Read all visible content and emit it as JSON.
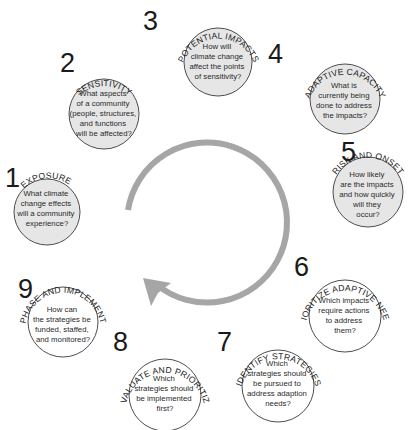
{
  "diagram": {
    "arrow_color": "#a6a6a6",
    "filled_color": "#e6e6e6",
    "empty_color": "#ffffff",
    "steps": [
      {
        "number": "1",
        "title": "EXPOSURE",
        "question_lines": [
          "What climate",
          "change effects",
          "will a community",
          "experience?"
        ],
        "filled": true
      },
      {
        "number": "2",
        "title": "SENSITIVITY",
        "question_lines": [
          "What aspects",
          "of a community",
          "(people, structures,",
          "and functions",
          "will be affected?"
        ],
        "filled": true
      },
      {
        "number": "3",
        "title": "POTENTIAL IMPACTS",
        "question_lines": [
          "How will",
          "climate change",
          "affect the points",
          "of sensitivity?"
        ],
        "filled": true
      },
      {
        "number": "4",
        "title": "ADAPTIVE CAPACITY",
        "question_lines": [
          "What is",
          "currently being",
          "done to address",
          "the impacts?"
        ],
        "filled": true
      },
      {
        "number": "5",
        "title": "RISK AND ONSET",
        "question_lines": [
          "How likely",
          "are the impacts",
          "and how quickly",
          "will they",
          "occur?"
        ],
        "filled": true
      },
      {
        "number": "6",
        "title": "PRIORITIZE ADAPTIVE NEEDS",
        "question_lines": [
          "Which impacts",
          "require actions",
          "to address",
          "them?"
        ],
        "filled": false
      },
      {
        "number": "7",
        "title": "IDENTIFY STRATEGIES",
        "question_lines": [
          "Which",
          "strategies should",
          "be pursued to",
          "address adaption",
          "needs?"
        ],
        "filled": false
      },
      {
        "number": "8",
        "title": "EVALUATE AND PRIORITIZE",
        "question_lines": [
          "Which",
          "strategies should",
          "be implemented",
          "first?"
        ],
        "filled": false
      },
      {
        "number": "9",
        "title": "PHASE AND IMPLEMENT",
        "question_lines": [
          "How can",
          "the strategies be",
          "funded, staffed,",
          "and monitored?"
        ],
        "filled": false
      }
    ]
  }
}
